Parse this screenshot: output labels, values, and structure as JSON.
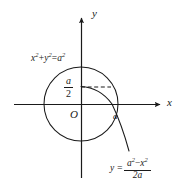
{
  "figure": {
    "axes": {
      "x_label": "x",
      "y_label": "y",
      "origin_label": "O"
    },
    "labels": {
      "circle_equation": {
        "text": "x²+y²=a²",
        "base_x": "x",
        "exp_x": "2",
        "plus": "+",
        "base_y": "y",
        "exp_y": "2",
        "equals": "=",
        "base_a": "a",
        "exp_a": "2"
      },
      "half_a": {
        "text": "a/2",
        "numerator": "a",
        "denominator": "2"
      },
      "point_a": "a",
      "curve_equation": {
        "text": "y = (a² − x²) / (2a)",
        "lhs": "y =",
        "numerator_a": "a",
        "numerator_a_exp": "2",
        "minus": "−",
        "numerator_x": "x",
        "numerator_x_exp": "2",
        "denominator": "2a"
      }
    },
    "colors": {
      "stroke": "#1a1a1a",
      "background": "#ffffff"
    },
    "geometry": {
      "origin_px": [
        81,
        104
      ],
      "circle_radius_px": 37,
      "dashed_line_y_px": 87
    }
  }
}
